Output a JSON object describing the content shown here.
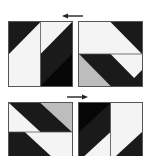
{
  "diagram": {
    "colors": {
      "black": "#1a1a1a",
      "deep_black": "#060606",
      "white": "#f4f4f4",
      "gray": "#bdbdbd",
      "border": "#555555"
    },
    "arrows": [
      {
        "id": "top-arrow",
        "direction": "left"
      },
      {
        "id": "bottom-arrow",
        "direction": "right"
      }
    ],
    "panels": [
      {
        "id": "top-left",
        "row": 1,
        "col": 1
      },
      {
        "id": "top-right",
        "row": 1,
        "col": 2
      },
      {
        "id": "bottom-left",
        "row": 2,
        "col": 1
      },
      {
        "id": "bottom-right",
        "row": 2,
        "col": 2
      }
    ]
  }
}
